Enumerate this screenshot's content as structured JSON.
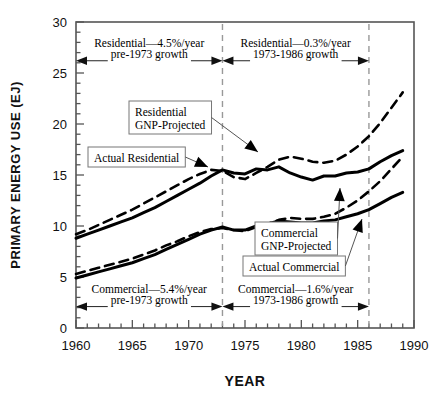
{
  "chart_data": {
    "type": "line",
    "title": "",
    "xlabel": "YEAR",
    "ylabel": "PRIMARY ENERGY USE (EJ)",
    "xlim": [
      1960,
      1990
    ],
    "ylim": [
      0,
      30
    ],
    "xticks": [
      1960,
      1965,
      1970,
      1975,
      1980,
      1985,
      1990
    ],
    "xtick_labels": [
      "1960",
      "1965",
      "1970",
      "1975",
      "1980",
      "1985",
      "1990"
    ],
    "yticks": [
      0,
      5,
      10,
      15,
      20,
      25,
      30
    ],
    "ytick_labels": [
      "0",
      "5",
      "10",
      "15",
      "20",
      "25",
      "30"
    ],
    "x_minor_step": 1,
    "y_minor_step": 1,
    "grid": false,
    "legend": "inline-callouts",
    "x": [
      1960,
      1961,
      1962,
      1963,
      1964,
      1965,
      1966,
      1967,
      1968,
      1969,
      1970,
      1971,
      1972,
      1973,
      1974,
      1975,
      1976,
      1977,
      1978,
      1979,
      1980,
      1981,
      1982,
      1983,
      1984,
      1985,
      1986,
      1987,
      1988,
      1989
    ],
    "series": [
      {
        "name": "Actual Residential",
        "style": "solid",
        "values": [
          8.8,
          9.2,
          9.6,
          10.0,
          10.4,
          10.8,
          11.3,
          11.8,
          12.4,
          13.0,
          13.6,
          14.2,
          14.9,
          15.5,
          15.2,
          15.1,
          15.6,
          15.5,
          15.8,
          15.2,
          14.8,
          14.5,
          14.9,
          14.9,
          15.2,
          15.3,
          15.6,
          16.3,
          16.9,
          17.4
        ]
      },
      {
        "name": "Residential GNP-Projected",
        "style": "dashed",
        "values": [
          9.2,
          9.6,
          10.1,
          10.6,
          11.1,
          11.6,
          12.2,
          12.8,
          13.4,
          14.0,
          14.6,
          15.1,
          15.5,
          15.4,
          14.8,
          14.6,
          15.2,
          15.8,
          16.5,
          16.8,
          16.6,
          16.3,
          16.2,
          16.4,
          17.0,
          17.8,
          18.8,
          20.1,
          21.6,
          23.1
        ]
      },
      {
        "name": "Actual Commercial",
        "style": "solid",
        "values": [
          4.9,
          5.2,
          5.5,
          5.8,
          6.1,
          6.4,
          6.8,
          7.2,
          7.7,
          8.2,
          8.7,
          9.2,
          9.6,
          9.9,
          9.6,
          9.6,
          10.0,
          10.2,
          10.5,
          10.4,
          10.3,
          10.3,
          10.5,
          10.6,
          10.9,
          11.2,
          11.6,
          12.2,
          12.8,
          13.3
        ]
      },
      {
        "name": "Commercial GNP-Projected",
        "style": "dashed",
        "values": [
          5.3,
          5.6,
          5.9,
          6.2,
          6.5,
          6.8,
          7.2,
          7.6,
          8.1,
          8.5,
          9.0,
          9.4,
          9.7,
          9.8,
          9.6,
          9.5,
          9.9,
          10.2,
          10.6,
          10.8,
          10.7,
          10.7,
          10.9,
          11.2,
          11.8,
          12.5,
          13.4,
          14.4,
          15.6,
          16.8
        ]
      }
    ],
    "reference_lines": [
      {
        "name": "year-1973-divider",
        "x": 1973,
        "style": "dashed"
      },
      {
        "name": "year-1986-divider",
        "x": 1986,
        "style": "dashed"
      }
    ],
    "annotations": {
      "top_left_span": {
        "line1": "Residential—4.5%/year",
        "line2": "pre-1973 growth",
        "from_year": 1960,
        "to_year": 1973
      },
      "top_right_span": {
        "line1": "Residential—0.3%/year",
        "line2": "1973-1986 growth",
        "from_year": 1973,
        "to_year": 1986
      },
      "bottom_left_span": {
        "line1": "Commercial—5.4%/year",
        "line2": "pre-1973 growth",
        "from_year": 1960,
        "to_year": 1973
      },
      "bottom_right_span": {
        "line1": "Commercial—1.6%/year",
        "line2": "1973-1986 growth",
        "from_year": 1973,
        "to_year": 1986
      }
    },
    "callouts": [
      {
        "name": "residential-gnp-projected",
        "line1": "Residential",
        "line2": "GNP-Projected"
      },
      {
        "name": "actual-residential",
        "line1": "Actual Residential",
        "line2": ""
      },
      {
        "name": "commercial-gnp-projected",
        "line1": "Commercial",
        "line2": "GNP-Projected"
      },
      {
        "name": "actual-commercial",
        "line1": "Actual Commercial",
        "line2": ""
      }
    ],
    "colors": {
      "line": "#000000",
      "axis": "#555555",
      "divider": "#999999",
      "background": "#ffffff"
    }
  }
}
